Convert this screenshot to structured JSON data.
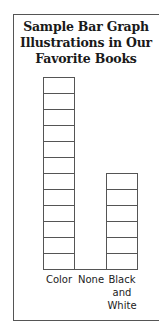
{
  "chart_data": {
    "type": "bar",
    "title": "Sample Bar Graph Illustrations in Our Favorite Books",
    "title_lines": [
      "Sample Bar Graph",
      "Illustrations in Our",
      "Favorite Books"
    ],
    "categories": [
      "Color",
      "None",
      "Black and White"
    ],
    "category_label_lines": [
      [
        "Color"
      ],
      [
        "None"
      ],
      [
        "Black",
        "and",
        "White"
      ]
    ],
    "values": [
      12,
      0,
      6
    ],
    "xlabel": "",
    "ylabel": "",
    "ylim": [
      0,
      12
    ],
    "grid": false,
    "legend": null,
    "bar_style": "stacked unit boxes (one box per book)",
    "colors": {
      "outline": "#555555",
      "fill": "#ffffff",
      "text": "#1a1a1a"
    }
  }
}
